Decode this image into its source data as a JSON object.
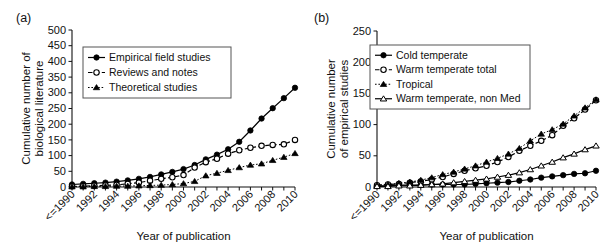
{
  "figure": {
    "panels": [
      {
        "label": "(a)",
        "xlabel": "Year of publication",
        "ylabel_line1": "Cumulative number of",
        "ylabel_line2": "biological literature"
      },
      {
        "label": "(b)",
        "xlabel": "Year of publication",
        "ylabel_line1": "Cumulative number",
        "ylabel_line2": "of empirical studies"
      }
    ]
  },
  "chart_data": [
    {
      "type": "line",
      "title": "(a)",
      "xlabel": "Year of publication",
      "ylabel": "Cumulative number of biological literature",
      "x": [
        "<=1990",
        "1991",
        "1992",
        "1993",
        "1994",
        "1995",
        "1996",
        "1997",
        "1998",
        "1999",
        "2000",
        "2001",
        "2002",
        "2003",
        "2004",
        "2005",
        "2006",
        "2007",
        "2008",
        "2009",
        "2010"
      ],
      "tick_labels": [
        "<=1990",
        "",
        "1992",
        "",
        "1994",
        "",
        "1996",
        "",
        "1998",
        "",
        "2000",
        "",
        "2002",
        "",
        "2004",
        "",
        "2006",
        "",
        "2008",
        "",
        "2010"
      ],
      "ylim": [
        0,
        500
      ],
      "yticks": [
        0,
        50,
        100,
        150,
        200,
        250,
        300,
        350,
        400,
        450,
        500
      ],
      "grid": false,
      "legend_position": "upper-left",
      "series": [
        {
          "name": "Empirical field studies",
          "marker": "filled-circle",
          "linestyle": "solid",
          "values": [
            8,
            10,
            12,
            14,
            17,
            21,
            26,
            32,
            40,
            48,
            57,
            70,
            88,
            103,
            120,
            144,
            180,
            218,
            251,
            283,
            316,
            359,
            440
          ]
        },
        {
          "name": "Reviews and notes",
          "marker": "open-circle",
          "linestyle": "dashed",
          "values": [
            2,
            3,
            4,
            5,
            7,
            10,
            14,
            20,
            26,
            31,
            38,
            62,
            79,
            90,
            106,
            117,
            125,
            131,
            134,
            136,
            150,
            167,
            184
          ]
        },
        {
          "name": "Theoretical studies",
          "marker": "filled-triangle",
          "linestyle": "dotted",
          "values": [
            1,
            1,
            2,
            2,
            3,
            3,
            4,
            5,
            6,
            8,
            11,
            18,
            36,
            44,
            53,
            62,
            70,
            74,
            85,
            95,
            107,
            128,
            143
          ]
        }
      ]
    },
    {
      "type": "line",
      "title": "(b)",
      "xlabel": "Year of publication",
      "ylabel": "Cumulative number of empirical studies",
      "x": [
        "<=1990",
        "1991",
        "1992",
        "1993",
        "1994",
        "1995",
        "1996",
        "1997",
        "1998",
        "1999",
        "2000",
        "2001",
        "2002",
        "2003",
        "2004",
        "2005",
        "2006",
        "2007",
        "2008",
        "2009",
        "2010"
      ],
      "tick_labels": [
        "<=1990",
        "",
        "1992",
        "",
        "1994",
        "",
        "1996",
        "",
        "1998",
        "",
        "2000",
        "",
        "2002",
        "",
        "2004",
        "",
        "2006",
        "",
        "2008",
        "",
        "2010"
      ],
      "ylim": [
        0,
        250
      ],
      "yticks": [
        0,
        50,
        100,
        150,
        200,
        250
      ],
      "grid": false,
      "legend_position": "upper-left",
      "series": [
        {
          "name": "Cold temperate",
          "marker": "filled-circle",
          "linestyle": "solid",
          "values": [
            2,
            2,
            3,
            3,
            3,
            4,
            4,
            4,
            4,
            5,
            6,
            7,
            8,
            10,
            12,
            15,
            17,
            19,
            21,
            22,
            26,
            29,
            33
          ]
        },
        {
          "name": "Warm temperate total",
          "marker": "open-circle",
          "linestyle": "dashed",
          "values": [
            3,
            4,
            5,
            7,
            9,
            12,
            16,
            21,
            26,
            30,
            34,
            40,
            48,
            58,
            66,
            74,
            83,
            98,
            110,
            124,
            139,
            151,
            165
          ]
        },
        {
          "name": "Tropical",
          "marker": "filled-triangle",
          "linestyle": "dotted",
          "values": [
            3,
            4,
            6,
            8,
            11,
            15,
            20,
            24,
            29,
            34,
            40,
            46,
            53,
            62,
            74,
            85,
            92,
            101,
            114,
            127,
            140,
            150,
            195
          ]
        },
        {
          "name": "Warm temperate, non Med",
          "marker": "open-triangle",
          "linestyle": "solid",
          "values": [
            1,
            1,
            2,
            2,
            3,
            4,
            5,
            7,
            9,
            11,
            13,
            16,
            19,
            23,
            28,
            34,
            40,
            47,
            53,
            60,
            66,
            75,
            87
          ]
        }
      ]
    }
  ]
}
